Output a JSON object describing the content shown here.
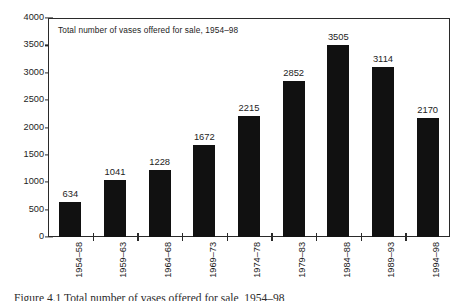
{
  "chart_data": {
    "type": "bar",
    "title": "Total number of vases offered for sale, 1954–98",
    "xlabel": "",
    "ylabel": "",
    "categories": [
      "1954–58",
      "1959–63",
      "1964–68",
      "1969–73",
      "1974–78",
      "1979–83",
      "1984–88",
      "1989–93",
      "1994–98"
    ],
    "values": [
      634,
      1041,
      1228,
      1672,
      2215,
      2852,
      3505,
      3114,
      2170
    ],
    "value_labels": [
      "634",
      "1041",
      "1228",
      "1672",
      "2215",
      "2852",
      "3505",
      "3114",
      "2170"
    ],
    "ylim": [
      0,
      4000
    ],
    "y_ticks": [
      0,
      500,
      1000,
      1500,
      2000,
      2500,
      3000,
      3500,
      4000
    ],
    "y_tick_labels": [
      "0",
      "500",
      "1000",
      "1500",
      "2000",
      "2500",
      "3000",
      "3500",
      "4000"
    ],
    "grid": false,
    "legend": null,
    "bar_color": "#111111",
    "frame_color": "#2a2a2a",
    "text_color": "#1d1d1d"
  },
  "caption": {
    "text": "Figure 4.1   Total number of vases offered for sale, 1954–98"
  }
}
